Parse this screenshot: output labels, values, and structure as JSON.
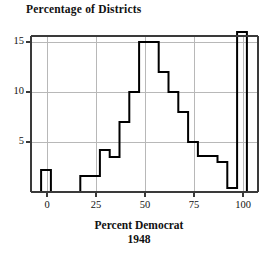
{
  "chart_data": {
    "type": "bar",
    "title": "Percentage of Districts",
    "xlabel": "Percent Democrat",
    "xlabel_secondary": "1948",
    "ylabel": "",
    "xlim": [
      -3,
      108
    ],
    "ylim": [
      0,
      16.2
    ],
    "grid": true,
    "legend": null,
    "bin_width": 5,
    "x_ticks": [
      0,
      25,
      50,
      75,
      100
    ],
    "y_ticks": [
      5,
      10,
      15
    ],
    "bin_starts": [
      -3,
      2,
      7,
      12,
      17,
      22,
      27,
      32,
      37,
      42,
      47,
      52,
      57,
      62,
      67,
      72,
      77,
      82,
      87,
      92,
      97
    ],
    "categories": [
      "-3",
      "2",
      "7",
      "12",
      "17",
      "22",
      "27",
      "32",
      "37",
      "42",
      "47",
      "52",
      "57",
      "62",
      "67",
      "72",
      "77",
      "82",
      "87",
      "92",
      "97"
    ],
    "values": [
      2.2,
      0,
      0,
      0,
      1.6,
      1.6,
      4.2,
      3.5,
      7.0,
      10.0,
      15.0,
      15.0,
      12.0,
      10.0,
      8.0,
      5.0,
      3.6,
      3.6,
      3.0,
      0.4,
      16.0
    ],
    "axis_color": "#3a3a3a",
    "grid_color": "#b8b8b8",
    "bar_line_color": "#000000",
    "bar_fill_color": "#ffffff"
  }
}
